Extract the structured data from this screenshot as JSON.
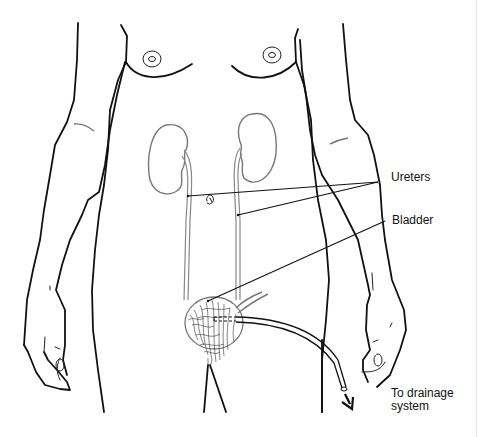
{
  "diagram": {
    "type": "anatomical-illustration",
    "labels": {
      "ureters": "Ureters",
      "bladder": "Bladder",
      "drainage_line1": "To drainage",
      "drainage_line2": "system"
    },
    "structures": [
      "kidney-left",
      "kidney-right",
      "ureter-left",
      "ureter-right",
      "bladder",
      "catheter",
      "drainage-arrow"
    ],
    "colors": {
      "outline": "#111111",
      "organ_outline": "#777777",
      "background": "#ffffff"
    }
  }
}
